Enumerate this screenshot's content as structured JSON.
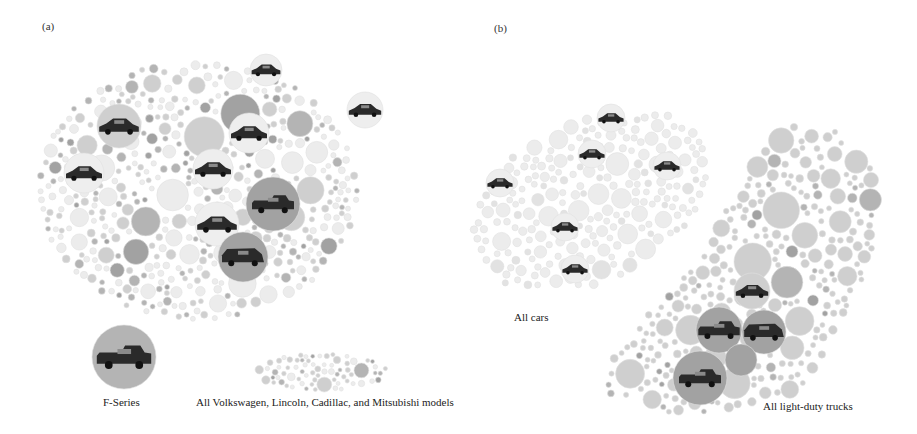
{
  "figure": {
    "panel_a_label": "(a)",
    "panel_b_label": "(b)",
    "colors": {
      "background": "#ffffff",
      "bubble_light": "#ececec",
      "bubble_mid": "#cfcfcf",
      "bubble_dark": "#b4b4b4",
      "bubble_darker": "#a2a2a2",
      "bubble_stroke": "#e0e0e0",
      "car_icon": "#2a2a2a",
      "text": "#222222"
    }
  },
  "panel_a": {
    "main_cluster": {
      "cx": 198,
      "cy": 190,
      "rx": 162,
      "ry": 132,
      "seed": 11,
      "density": "mixed"
    },
    "f_series": {
      "label": "F-Series",
      "cx": 124,
      "cy": 357,
      "r": 32,
      "icon": "pickup-truck-icon"
    },
    "minor_brands": {
      "label": "All Volkswagen, Lincoln, Cadillac, and Mitsubishi models",
      "cx": 321,
      "cy": 372,
      "rx": 68,
      "ry": 20,
      "seed": 5
    },
    "highlighted_models": [
      {
        "icon": "sedan-icon",
        "cx": 266,
        "cy": 70,
        "r": 16,
        "tone": "light"
      },
      {
        "icon": "sedan-icon",
        "cx": 119,
        "cy": 126,
        "r": 22,
        "tone": "mid"
      },
      {
        "icon": "sedan-icon",
        "cx": 249,
        "cy": 133,
        "r": 20,
        "tone": "light"
      },
      {
        "icon": "sedan-icon",
        "cx": 365,
        "cy": 110,
        "r": 18,
        "tone": "light"
      },
      {
        "icon": "sedan-icon",
        "cx": 84,
        "cy": 173,
        "r": 20,
        "tone": "light"
      },
      {
        "icon": "sedan-icon",
        "cx": 213,
        "cy": 169,
        "r": 20,
        "tone": "light"
      },
      {
        "icon": "sedan-icon",
        "cx": 217,
        "cy": 224,
        "r": 22,
        "tone": "light"
      },
      {
        "icon": "pickup-truck-icon",
        "cx": 273,
        "cy": 204,
        "r": 27,
        "tone": "dark"
      },
      {
        "icon": "suv-icon",
        "cx": 243,
        "cy": 257,
        "r": 25,
        "tone": "dark"
      }
    ]
  },
  "panel_b": {
    "cars_cluster": {
      "label": "All cars",
      "cx": 590,
      "cy": 200,
      "rx": 128,
      "ry": 85,
      "rotate": -28,
      "seed": 21
    },
    "trucks_cluster": {
      "label": "All light-duty trucks",
      "seed": 33,
      "polygon": [
        [
          783,
          123
        ],
        [
          835,
          130
        ],
        [
          880,
          175
        ],
        [
          875,
          255
        ],
        [
          840,
          330
        ],
        [
          800,
          395
        ],
        [
          740,
          415
        ],
        [
          650,
          415
        ],
        [
          605,
          395
        ],
        [
          610,
          355
        ],
        [
          700,
          255
        ],
        [
          740,
          180
        ]
      ]
    },
    "highlighted_models": [
      {
        "icon": "sedan-icon",
        "cx": 611,
        "cy": 118,
        "r": 14,
        "tone": "light"
      },
      {
        "icon": "sedan-icon",
        "cx": 592,
        "cy": 154,
        "r": 14,
        "tone": "light"
      },
      {
        "icon": "sedan-icon",
        "cx": 667,
        "cy": 166,
        "r": 14,
        "tone": "light"
      },
      {
        "icon": "sedan-icon",
        "cx": 500,
        "cy": 183,
        "r": 14,
        "tone": "light"
      },
      {
        "icon": "sedan-icon",
        "cx": 565,
        "cy": 227,
        "r": 14,
        "tone": "light"
      },
      {
        "icon": "sedan-icon",
        "cx": 575,
        "cy": 269,
        "r": 14,
        "tone": "light"
      },
      {
        "icon": "sedan-icon",
        "cx": 752,
        "cy": 291,
        "r": 18,
        "tone": "mid"
      },
      {
        "icon": "pickup-truck-icon",
        "cx": 719,
        "cy": 330,
        "r": 23,
        "tone": "dark"
      },
      {
        "icon": "suv-icon",
        "cx": 764,
        "cy": 332,
        "r": 22,
        "tone": "dark"
      },
      {
        "icon": "pickup-truck-icon",
        "cx": 700,
        "cy": 378,
        "r": 27,
        "tone": "dark"
      },
      {
        "icon": "none",
        "cx": 741,
        "cy": 360,
        "r": 16,
        "tone": "dark"
      }
    ]
  },
  "captions": [
    {
      "id": "f-series",
      "text": "F-Series",
      "x": 103,
      "y": 396
    },
    {
      "id": "minor-brands",
      "text": "All Volkswagen, Lincoln, Cadillac, and Mitsubishi models",
      "x": 196,
      "y": 396
    },
    {
      "id": "all-cars",
      "text": "All cars",
      "x": 514,
      "y": 311
    },
    {
      "id": "all-trucks",
      "text": "All light-duty trucks",
      "x": 763,
      "y": 400
    }
  ]
}
